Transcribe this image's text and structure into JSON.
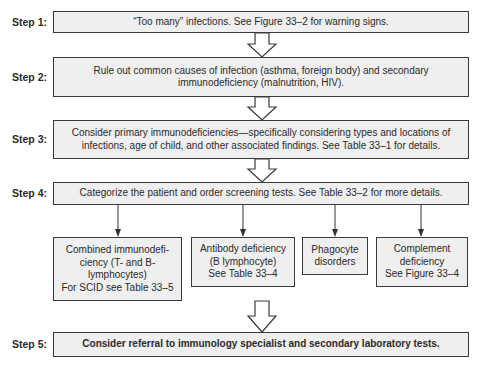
{
  "steps": [
    {
      "label": "Step 1:",
      "text": "“Too many” infections. See Figure 33–2 for warning signs."
    },
    {
      "label": "Step 2:",
      "text": "Rule out common causes of infection (asthma, foreign body) and secondary immunodeficiency (malnutrition, HIV)."
    },
    {
      "label": "Step 3:",
      "text": "Consider primary immunodeficiencies—specifically considering types and locations of infections, age of child, and other associated findings. See Table 33–1 for details."
    },
    {
      "label": "Step 4:",
      "text": "Categorize the patient and order screening tests. See Table 33–2 for more details."
    },
    {
      "label": "Step 5:",
      "text": "Consider referral to immunology specialist and secondary laboratory tests."
    }
  ],
  "categories": [
    {
      "line1": "Combined immunodefi-",
      "line2": "ciency (T- and B-",
      "line3": "lymphocytes)",
      "line4": "For SCID see Table 33–5"
    },
    {
      "line1": "Antibody deficiency",
      "line2": "(B lymphocyte)",
      "line3": "See Table 33–4"
    },
    {
      "line1": "Phagocyte",
      "line2": "disorders"
    },
    {
      "line1": "Complement",
      "line2": "deficiency",
      "line3": "See Figure 33–4"
    }
  ],
  "colors": {
    "box_fill": "#efefef",
    "border": "#3a3a3a",
    "arrow_fill": "#ffffff"
  }
}
